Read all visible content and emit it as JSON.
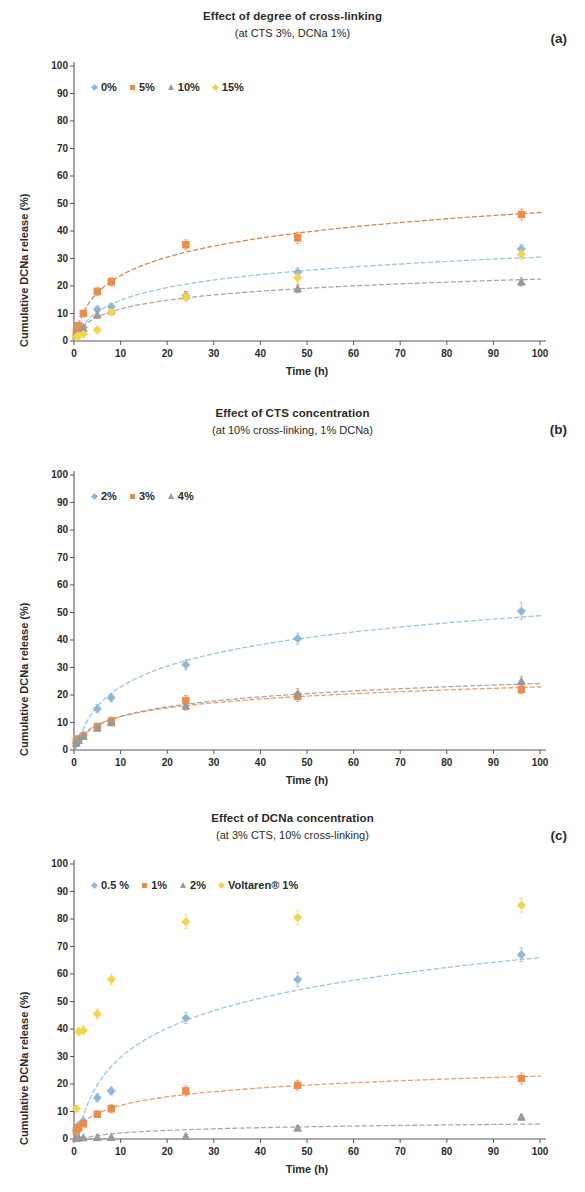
{
  "figure": {
    "axis_y_label": "Cumulative DCNa release (%)",
    "axis_x_label": "Time (h)",
    "y_ticks": [
      "0",
      "10",
      "20",
      "30",
      "40",
      "50",
      "60",
      "70",
      "80",
      "90",
      "100"
    ],
    "x_ticks": [
      "0",
      "10",
      "20",
      "30",
      "40",
      "50",
      "60",
      "70",
      "80",
      "90",
      "100"
    ],
    "colors": {
      "blue": "#8eb8dd",
      "orange": "#ed8c49",
      "gray": "#9a9a9a",
      "yellow": "#f5d544",
      "axis": "#595959"
    }
  },
  "panels": [
    {
      "label": "(a)",
      "title": "Effect of degree of cross-linking",
      "subtitle": "(at CTS 3%, DCNa 1%)"
    },
    {
      "label": "(b)",
      "title": "Effect of CTS concentration",
      "subtitle": "(at 10% cross-linking, 1% DCNa)"
    },
    {
      "label": "(c)",
      "title": "Effect of DCNa concentration",
      "subtitle": "(at 3% CTS, 10% cross-linking)"
    }
  ],
  "chart_data": [
    {
      "type": "scatter",
      "panel": "(a)",
      "title": "Effect of degree of cross-linking",
      "subtitle": "(at CTS 3%, DCNa 1%)",
      "xlabel": "Time (h)",
      "ylabel": "Cumulative DCNa release (%)",
      "xlim": [
        0,
        100
      ],
      "ylim": [
        0,
        100
      ],
      "grid": false,
      "legend_position": "top-left",
      "x": [
        0.5,
        1,
        2,
        5,
        8,
        24,
        48,
        96
      ],
      "series": [
        {
          "name": "0%",
          "marker": "diamond",
          "color": "#8eb8dd",
          "values": [
            2.0,
            3.5,
            5.0,
            11.5,
            12.5,
            16.5,
            25.0,
            33.5
          ],
          "errors": [
            0.8,
            0.8,
            1.0,
            1.2,
            1.2,
            1.5,
            1.8,
            1.5
          ]
        },
        {
          "name": "5%",
          "marker": "square",
          "color": "#ed8c49",
          "values": [
            3.5,
            5.5,
            10.0,
            18.0,
            21.5,
            35.0,
            37.5,
            46.0
          ],
          "errors": [
            1.0,
            1.0,
            1.2,
            1.5,
            1.5,
            1.8,
            2.0,
            2.0
          ]
        },
        {
          "name": "10%",
          "marker": "triangle",
          "color": "#9a9a9a",
          "values": [
            2.0,
            3.0,
            4.5,
            9.5,
            11.0,
            16.5,
            19.0,
            21.5
          ],
          "errors": [
            0.8,
            0.8,
            1.0,
            1.2,
            1.2,
            1.5,
            1.5,
            1.5
          ]
        },
        {
          "name": "15%",
          "marker": "diamond",
          "color": "#f5d544",
          "values": [
            1.5,
            2.0,
            2.5,
            4.0,
            10.5,
            16.0,
            23.0,
            31.5
          ],
          "errors": [
            0.8,
            0.8,
            0.8,
            1.0,
            1.2,
            1.5,
            1.8,
            1.8
          ]
        }
      ],
      "trend_lines": [
        {
          "name": "0%",
          "color": "#8eb8dd"
        },
        {
          "name": "5%",
          "color": "#c8742f"
        },
        {
          "name": "10%",
          "color": "#9a9a9a"
        }
      ]
    },
    {
      "type": "scatter",
      "panel": "(b)",
      "title": "Effect of CTS concentration",
      "subtitle": "(at 10% cross-linking, 1% DCNa)",
      "xlabel": "Time (h)",
      "ylabel": "Cumulative DCNa release (%)",
      "xlim": [
        0,
        100
      ],
      "ylim": [
        0,
        100
      ],
      "grid": false,
      "legend_position": "top-left",
      "x": [
        0.5,
        1,
        2,
        5,
        8,
        24,
        48,
        96
      ],
      "series": [
        {
          "name": "2%",
          "marker": "diamond",
          "color": "#8eb8dd",
          "values": [
            2.5,
            4.0,
            5.5,
            15.0,
            19.0,
            31.0,
            40.5,
            50.5
          ],
          "errors": [
            0.8,
            1.0,
            1.0,
            1.5,
            1.5,
            1.8,
            2.0,
            3.0
          ]
        },
        {
          "name": "3%",
          "marker": "square",
          "color": "#ed8c49",
          "values": [
            3.0,
            4.0,
            5.0,
            8.5,
            10.5,
            18.0,
            19.5,
            22.0
          ],
          "errors": [
            1.0,
            1.0,
            1.0,
            1.2,
            1.5,
            1.8,
            1.8,
            1.5
          ]
        },
        {
          "name": "4%",
          "marker": "triangle",
          "color": "#9a9a9a",
          "values": [
            2.5,
            3.5,
            5.0,
            8.0,
            10.0,
            16.0,
            20.5,
            25.0
          ],
          "errors": [
            0.8,
            1.0,
            1.0,
            1.2,
            1.2,
            1.5,
            1.8,
            1.8
          ]
        }
      ],
      "trend_lines": [
        {
          "name": "2%",
          "color": "#8eb8dd"
        },
        {
          "name": "3%",
          "color": "#ed8c49"
        },
        {
          "name": "4%",
          "color": "#9a9a9a"
        }
      ]
    },
    {
      "type": "scatter",
      "panel": "(c)",
      "title": "Effect of DCNa concentration",
      "subtitle": "(at 3% CTS, 10% cross-linking)",
      "xlabel": "Time (h)",
      "ylabel": "Cumulative DCNa release (%)",
      "xlim": [
        0,
        100
      ],
      "ylim": [
        0,
        100
      ],
      "grid": false,
      "legend_position": "top-left",
      "x": [
        0.5,
        1,
        2,
        5,
        8,
        24,
        48,
        96
      ],
      "series": [
        {
          "name": "0.5 %",
          "marker": "diamond",
          "color": "#8eb8dd",
          "values": [
            3.0,
            5.0,
            6.5,
            15.0,
            17.5,
            44.0,
            58.0,
            67.0
          ],
          "errors": [
            1.0,
            1.0,
            1.2,
            1.5,
            1.5,
            2.0,
            2.5,
            2.5
          ]
        },
        {
          "name": "1%",
          "marker": "square",
          "color": "#ed8c49",
          "values": [
            3.0,
            4.0,
            5.5,
            9.0,
            11.0,
            17.5,
            19.5,
            22.0
          ],
          "errors": [
            1.0,
            1.0,
            1.0,
            1.2,
            1.5,
            1.8,
            1.8,
            2.0
          ]
        },
        {
          "name": "2%",
          "marker": "triangle",
          "color": "#9a9a9a",
          "values": [
            0.3,
            0.4,
            0.5,
            0.6,
            0.6,
            1.0,
            4.0,
            8.0
          ],
          "errors": [
            0.3,
            0.3,
            0.3,
            0.3,
            0.3,
            0.5,
            0.8,
            1.0
          ]
        },
        {
          "name": "Voltaren® 1%",
          "marker": "diamond",
          "color": "#f5d544",
          "values": [
            11.0,
            39.0,
            39.5,
            45.5,
            58.0,
            79.0,
            80.5,
            85.0
          ],
          "errors": [
            1.0,
            1.5,
            1.5,
            1.8,
            2.0,
            2.5,
            2.5,
            2.5
          ]
        }
      ],
      "trend_lines": [
        {
          "name": "0.5 %",
          "color": "#8eb8dd"
        },
        {
          "name": "1%",
          "color": "#ed8c49"
        },
        {
          "name": "2%",
          "color": "#9a9a9a"
        }
      ]
    }
  ]
}
